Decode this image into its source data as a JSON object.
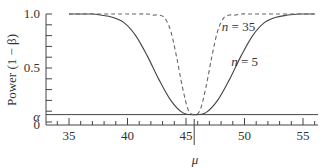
{
  "chart_data": {
    "type": "line",
    "title": "",
    "xlabel": "μ",
    "ylabel": "Power (1 − β)",
    "xlim": [
      34,
      56.2
    ],
    "ylim": [
      0,
      1.0
    ],
    "x_ticks_major": [
      35,
      40,
      45,
      50,
      55
    ],
    "x_tick_labels": [
      "35",
      "40",
      "45",
      "50",
      "55"
    ],
    "y_ticks_labeled": [
      {
        "value": 1.0,
        "label": "1.0"
      },
      {
        "value": 0.5,
        "label": "0.5"
      },
      {
        "value": 0.05,
        "label": "α"
      },
      {
        "value": 0,
        "label": "0"
      }
    ],
    "alpha": 0.05,
    "mu0": 45.7,
    "grid": false,
    "legend": "none (inline annotations)",
    "annotations": [
      {
        "text": "n = 35",
        "x": 49.6,
        "y": 0.88
      },
      {
        "text": "n = 5",
        "x": 50.4,
        "y": 0.56
      }
    ],
    "series": [
      {
        "name": "n = 5",
        "style": "solid",
        "x": [
          35,
          36,
          37,
          37.7,
          38.7,
          39.7,
          40.7,
          41.7,
          42.7,
          43.7,
          44.7,
          45.7,
          46.7,
          47.7,
          48.7,
          49.7,
          50.7,
          51.7,
          52.7,
          53.7,
          54.7,
          55.7,
          56
        ],
        "values": [
          1.0,
          1.0,
          1.0,
          0.99,
          0.97,
          0.92,
          0.8,
          0.61,
          0.39,
          0.2,
          0.087,
          0.05,
          0.087,
          0.2,
          0.39,
          0.61,
          0.8,
          0.92,
          0.97,
          0.99,
          1.0,
          1.0,
          1.0
        ]
      },
      {
        "name": "n = 35",
        "style": "dashed",
        "x": [
          35,
          40,
          41.7,
          42.2,
          42.7,
          43.2,
          43.7,
          44.2,
          44.7,
          45.2,
          45.7,
          46.2,
          46.7,
          47.2,
          47.7,
          48.2,
          48.7,
          49.2,
          49.7,
          51.4,
          56
        ],
        "values": [
          1.0,
          1.0,
          1.0,
          0.99,
          0.99,
          0.96,
          0.84,
          0.6,
          0.32,
          0.11,
          0.05,
          0.11,
          0.32,
          0.6,
          0.84,
          0.96,
          0.99,
          0.99,
          1.0,
          1.0,
          1.0
        ]
      }
    ]
  }
}
